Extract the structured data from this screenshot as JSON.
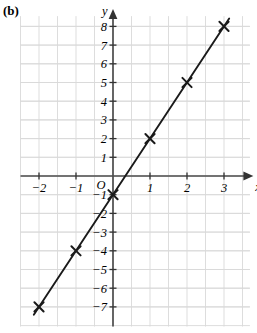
{
  "figure": {
    "part_label": "(b)"
  },
  "chart_data": {
    "type": "line",
    "title": "",
    "subtitle": "",
    "xlabel": "x",
    "ylabel": "y",
    "origin_label": "O",
    "grid": true,
    "grid_minor_step_x": 0.5,
    "grid_minor_step_y": 0.5,
    "legend": null,
    "xlim": [
      -2.9,
      3.75
    ],
    "ylim": [
      -8.1,
      8.8
    ],
    "xticks": [
      -2,
      -1,
      1,
      2,
      3
    ],
    "xtick_labels": [
      "−2",
      "−1",
      "1",
      "2",
      "3"
    ],
    "yticks": [
      8,
      7,
      6,
      5,
      4,
      3,
      2,
      1,
      -1,
      -2,
      -3,
      -4,
      -5,
      -6,
      -7
    ],
    "ytick_labels": [
      "8",
      "7",
      "6",
      "5",
      "4",
      "3",
      "2",
      "1",
      "−1",
      "−2",
      "−3",
      "−4",
      "−5",
      "−6",
      "−7"
    ],
    "series": [
      {
        "name": "line",
        "marker": "cross",
        "x": [
          -2,
          -1,
          0,
          1,
          2,
          3
        ],
        "y": [
          -7,
          -4,
          -1,
          2,
          5,
          8
        ],
        "points": [
          {
            "x": -2,
            "y": -7
          },
          {
            "x": -1,
            "y": -4
          },
          {
            "x": 0,
            "y": -1
          },
          {
            "x": 1,
            "y": 2
          },
          {
            "x": 2,
            "y": 5
          },
          {
            "x": 3,
            "y": 8
          }
        ]
      }
    ],
    "colors": {
      "line": "#1a1a1a",
      "marker": "#1a1a1a",
      "axis": "#4d4d4d",
      "grid_minor": "#d9d9d9",
      "grid_major": "#bfbfbf"
    }
  }
}
